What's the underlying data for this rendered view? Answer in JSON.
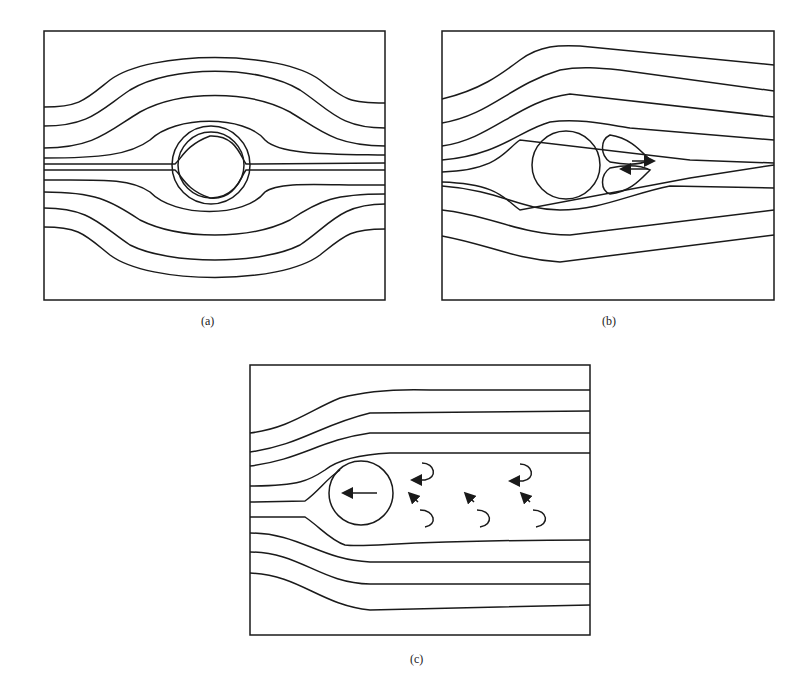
{
  "figure": {
    "panels": [
      {
        "id": "a",
        "label": "(a)",
        "description": "Symmetric streamlines around a circular cylinder (potential flow)"
      },
      {
        "id": "b",
        "label": "(b)",
        "description": "Flow past cylinder with a pair of attached recirculating vortices in the wake"
      },
      {
        "id": "c",
        "label": "(c)",
        "description": "Cylinder moving left with vortex street in the wake"
      }
    ],
    "colors": {
      "stroke": "#1a1a1a",
      "background": "#ffffff"
    }
  }
}
